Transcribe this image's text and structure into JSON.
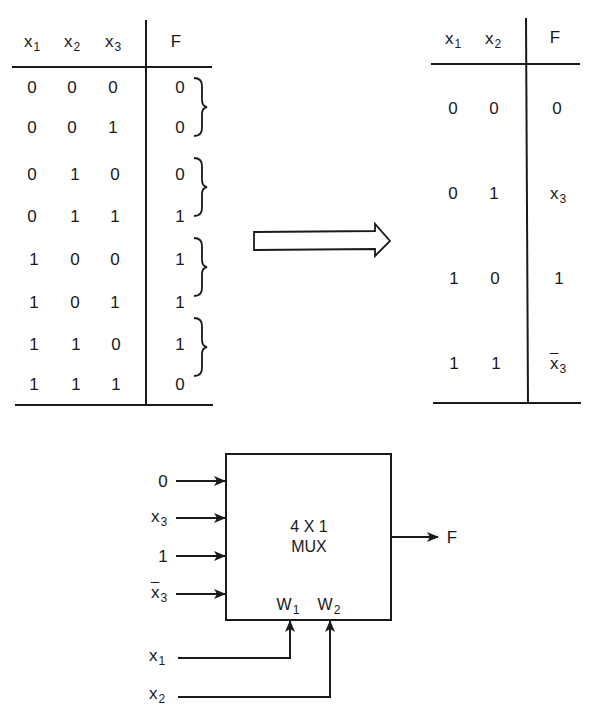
{
  "left_table": {
    "headers": [
      {
        "base": "x",
        "sub": "1"
      },
      {
        "base": "x",
        "sub": "2"
      },
      {
        "base": "x",
        "sub": "3"
      },
      {
        "base": "F",
        "sub": ""
      }
    ],
    "rows": [
      [
        "0",
        "0",
        "0",
        "0"
      ],
      [
        "0",
        "0",
        "1",
        "0"
      ],
      [
        "0",
        "1",
        "0",
        "0"
      ],
      [
        "0",
        "1",
        "1",
        "1"
      ],
      [
        "1",
        "0",
        "0",
        "1"
      ],
      [
        "1",
        "0",
        "1",
        "1"
      ],
      [
        "1",
        "1",
        "0",
        "1"
      ],
      [
        "1",
        "1",
        "1",
        "0"
      ]
    ],
    "brace_groups": 4
  },
  "transform_arrow": "hollow-right-arrow",
  "right_table": {
    "headers": [
      {
        "base": "x",
        "sub": "1"
      },
      {
        "base": "x",
        "sub": "2"
      },
      {
        "base": "F",
        "sub": ""
      }
    ],
    "rows": [
      {
        "x1": "0",
        "x2": "0",
        "F": {
          "base": "0",
          "sub": "",
          "complement": false
        }
      },
      {
        "x1": "0",
        "x2": "1",
        "F": {
          "base": "x",
          "sub": "3",
          "complement": false
        }
      },
      {
        "x1": "1",
        "x2": "0",
        "F": {
          "base": "1",
          "sub": "",
          "complement": false
        }
      },
      {
        "x1": "1",
        "x2": "1",
        "F": {
          "base": "x",
          "sub": "3",
          "complement": true
        }
      }
    ]
  },
  "mux": {
    "label_line1": "4 X 1",
    "label_line2": "MUX",
    "inputs": [
      {
        "base": "0",
        "sub": "",
        "complement": false
      },
      {
        "base": "x",
        "sub": "3",
        "complement": false
      },
      {
        "base": "1",
        "sub": "",
        "complement": false
      },
      {
        "base": "x",
        "sub": "3",
        "complement": true
      }
    ],
    "selects": [
      {
        "pin": "W",
        "pin_sub": "1",
        "signal": "x",
        "signal_sub": "1"
      },
      {
        "pin": "W",
        "pin_sub": "2",
        "signal": "x",
        "signal_sub": "2"
      }
    ],
    "output": "F"
  }
}
